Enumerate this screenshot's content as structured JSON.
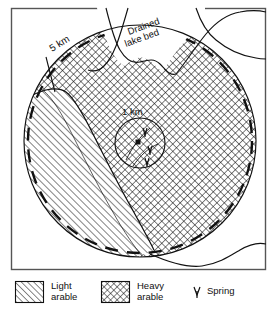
{
  "figure": {
    "type": "site-catchment-map",
    "caption_labels": {
      "outer_radius": "5 km",
      "inner_radius": "1 km",
      "lake": "Drained lake bed"
    },
    "colors": {
      "ink": "#111111",
      "paper": "#ffffff",
      "frame": "#555555"
    }
  },
  "map": {
    "frame": {
      "x": 11,
      "y": 8,
      "width": 255,
      "height": 262
    },
    "outer_circle": {
      "cx": 140,
      "cy": 141,
      "r": 116,
      "label": "5 km"
    },
    "inner_circle": {
      "cx": 140,
      "cy": 143,
      "r": 25,
      "label": "1 km"
    },
    "site_marker": {
      "cx": 138,
      "cy": 142,
      "size": 5,
      "name": "site"
    },
    "lake_label": {
      "line1": "Drained",
      "line2": "lake bed"
    },
    "zones": [
      {
        "key": "light",
        "label": "Light arable",
        "pattern": "diagonal-hatch"
      },
      {
        "key": "heavy",
        "label": "Heavy arable",
        "pattern": "cross-hatch"
      }
    ],
    "springs": [
      {
        "cx": 146,
        "cy": 133
      },
      {
        "cx": 150,
        "cy": 150
      },
      {
        "cx": 147,
        "cy": 160
      }
    ]
  },
  "legend": {
    "items": [
      {
        "key": "light-arable",
        "line1": "Light",
        "line2": "arable",
        "swatch": "diagonal-hatch"
      },
      {
        "key": "heavy-arable",
        "line1": "Heavy",
        "line2": "arable",
        "swatch": "cross-hatch"
      },
      {
        "key": "spring",
        "line1": "Spring",
        "line2": "",
        "swatch": "spring-glyph"
      }
    ]
  }
}
